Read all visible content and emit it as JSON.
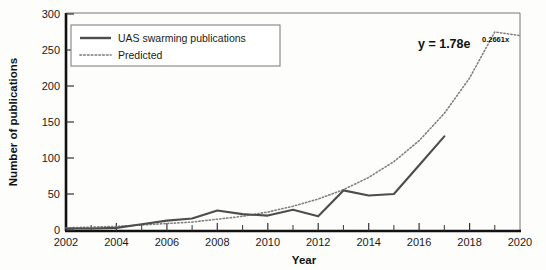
{
  "chart_data": {
    "type": "line",
    "title": "",
    "xlabel": "Year",
    "ylabel": "Number of publications",
    "xlim": [
      2002,
      2020
    ],
    "ylim": [
      0,
      300
    ],
    "xticks": [
      "2002",
      "2004",
      "2006",
      "2008",
      "2010",
      "2012",
      "2014",
      "2016",
      "2018",
      "2020"
    ],
    "yticks": [
      "0",
      "50",
      "100",
      "150",
      "200",
      "250",
      "300"
    ],
    "grid": false,
    "legend_position": "top-left",
    "x": [
      2002,
      2003,
      2004,
      2005,
      2006,
      2007,
      2008,
      2009,
      2010,
      2011,
      2012,
      2013,
      2014,
      2015,
      2016,
      2017,
      2018,
      2019,
      2020
    ],
    "series": [
      {
        "name": "UAS swarming publications",
        "style": "solid",
        "color": "#4d4d4d",
        "values": [
          2,
          2,
          3,
          8,
          13,
          16,
          27,
          22,
          20,
          28,
          19,
          55,
          48,
          50,
          90,
          130,
          null,
          null,
          null
        ]
      },
      {
        "name": "Predicted",
        "style": "dotted",
        "color": "#808080",
        "values": [
          3,
          4,
          5,
          7,
          9,
          11,
          15,
          19,
          25,
          33,
          43,
          56,
          73,
          95,
          124,
          162,
          211,
          275,
          270
        ]
      }
    ],
    "annotations": [
      {
        "name": "trendline-equation",
        "text": "y = 1.78e",
        "superscript": "0.2661x",
        "full": "y = 1.78e^0.2661x"
      }
    ]
  },
  "legend": {
    "items": [
      {
        "label": "UAS swarming publications",
        "style": "solid"
      },
      {
        "label": "Predicted",
        "style": "dotted"
      }
    ]
  },
  "axes": {
    "x_title": "Year",
    "y_title": "Number of publications"
  },
  "colors": {
    "observed": "#4d4d4d",
    "predicted": "#808080",
    "axis": "#111111",
    "background": "#fdfdfc"
  }
}
